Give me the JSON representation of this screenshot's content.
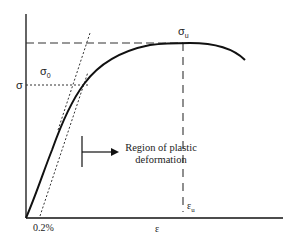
{
  "diagram": {
    "type": "stress-strain curve",
    "labels": {
      "sigma_axis": "σ",
      "sigma0": "σ",
      "sigma0_sub": "0",
      "sigma_u": "σ",
      "sigma_u_sub": "u",
      "epsilon_axis": "ε",
      "epsilon_u": "ε",
      "epsilon_u_sub": "u",
      "offset": "0.2%",
      "region_line1": "Region of plastic",
      "region_line2": "deformation"
    },
    "colors": {
      "line": "#111111",
      "text": "#222222",
      "background": "#ffffff"
    }
  }
}
